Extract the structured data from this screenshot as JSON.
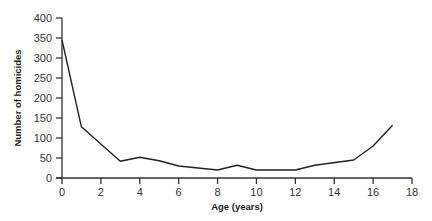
{
  "chart_data": {
    "type": "line",
    "title": "",
    "xlabel": "Age (years)",
    "ylabel": "Number of homicides",
    "xlim": [
      0,
      18
    ],
    "ylim": [
      0,
      400
    ],
    "x_ticks": [
      0,
      2,
      4,
      6,
      8,
      10,
      12,
      14,
      16,
      18
    ],
    "y_ticks": [
      0,
      50,
      100,
      150,
      200,
      250,
      300,
      350,
      400
    ],
    "grid": false,
    "legend": null,
    "series": [
      {
        "name": "Homicides",
        "color": "#222222",
        "x": [
          0,
          1,
          3,
          4,
          5,
          6,
          8,
          9,
          10,
          12,
          13,
          15,
          16,
          17
        ],
        "values": [
          345,
          128,
          42,
          52,
          43,
          30,
          20,
          32,
          20,
          20,
          32,
          45,
          80,
          132
        ]
      }
    ]
  }
}
